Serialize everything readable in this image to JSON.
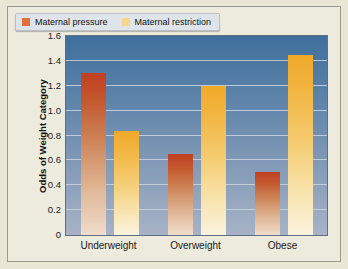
{
  "chart_data": {
    "type": "bar",
    "title": "",
    "xlabel": "",
    "ylabel": "Odds of Weight Category",
    "categories": [
      "Underweight",
      "Overweight",
      "Obese"
    ],
    "series": [
      {
        "name": "Maternal pressure",
        "color": "#c0441f",
        "values": [
          1.3,
          0.65,
          0.51
        ]
      },
      {
        "name": "Maternal restriction",
        "color": "#f0a92a",
        "values": [
          0.84,
          1.2,
          1.45
        ]
      }
    ],
    "ylim": [
      0,
      1.6
    ],
    "yticks": [
      "0",
      "0.2",
      "0.4",
      "0.6",
      "0.8",
      "1.0",
      "1.2",
      "1.4",
      "1.6"
    ],
    "ytick_values": [
      0,
      0.2,
      0.4,
      0.6,
      0.8,
      1.0,
      1.2,
      1.4,
      1.6
    ],
    "grid": true,
    "legend_position": "top-left",
    "plot_background": "#3f6f9c",
    "figure_background": "#edeade"
  }
}
